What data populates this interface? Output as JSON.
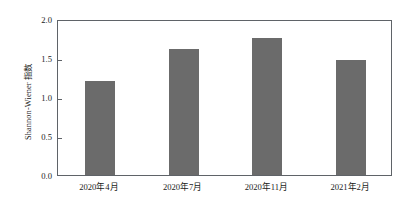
{
  "chart_data": {
    "type": "bar",
    "title": "",
    "xlabel": "",
    "ylabel": "Shannon-Wiener 指数",
    "categories": [
      "2020年4月",
      "2020年7月",
      "2020年11月",
      "2021年2月"
    ],
    "values": [
      1.21,
      1.62,
      1.76,
      1.47
    ],
    "series": [
      {
        "name": "Shannon-Wiener 指数",
        "values": [
          1.21,
          1.62,
          1.76,
          1.47
        ]
      }
    ],
    "ylim": [
      0.0,
      2.0
    ],
    "yticks": [
      0.0,
      0.5,
      1.0,
      1.5,
      2.0
    ],
    "ytick_labels": [
      "0.0",
      "0.5",
      "1.0",
      "1.5",
      "2.0"
    ],
    "grid": false,
    "legend": null,
    "legend_position": "none",
    "bar_color": "#6b6b6b",
    "axis_color": "#5f6368",
    "background_color": "#ffffff",
    "text_color": "#1a1a1a"
  }
}
